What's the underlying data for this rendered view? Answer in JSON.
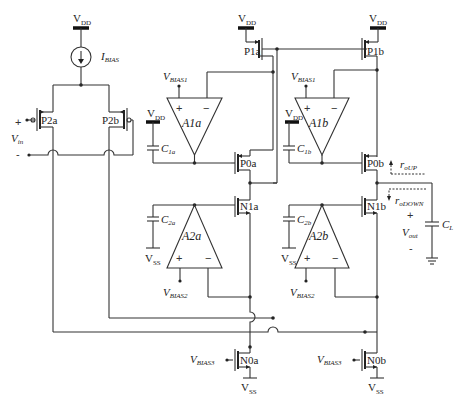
{
  "labels": {
    "vdd": "V",
    "vdd_sub": "DD",
    "vss": "V",
    "vss_sub": "SS",
    "ibias": "I",
    "ibias_sub": "BIAS",
    "vin": "V",
    "vin_sub": "in",
    "vin_plus": "+",
    "vin_minus": "-",
    "vbias1": "V",
    "vbias1_sub": "BIAS1",
    "vbias2": "V",
    "vbias2_sub": "BIAS2",
    "vbias3": "V",
    "vbias3_sub": "BIAS3",
    "vout": "V",
    "vout_sub": "out",
    "vout_plus": "+",
    "vout_minus": "-",
    "roup": "r",
    "roup_sub": "oUP",
    "rodown": "r",
    "rodown_sub": "oDOWN",
    "cl": "C",
    "cl_sub": "L",
    "c1a": "C",
    "c1a_sub": "1a",
    "c1b": "C",
    "c1b_sub": "1b",
    "c2a": "C",
    "c2a_sub": "2a",
    "c2b": "C",
    "c2b_sub": "2b",
    "opamp_plus": "+",
    "opamp_minus": "−"
  },
  "transistors": {
    "p2a": "P2a",
    "p2b": "P2b",
    "p1a": "P1a",
    "p1b": "P1b",
    "p0a": "P0a",
    "p0b": "P0b",
    "n1a": "N1a",
    "n1b": "N1b",
    "n0a": "N0a",
    "n0b": "N0b"
  },
  "amplifiers": {
    "a1a": "A1a",
    "a1b": "A1b",
    "a2a": "A2a",
    "a2b": "A2b"
  }
}
